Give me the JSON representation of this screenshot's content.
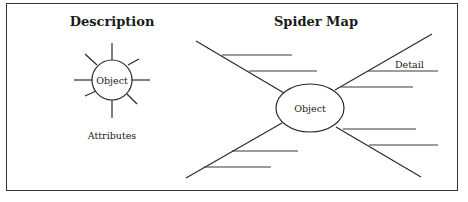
{
  "description_panel": {
    "title": "Description",
    "center_label": "Object",
    "caption": "Attributes",
    "ray_count": 8
  },
  "spider_map_panel": {
    "title": "Spider Map",
    "center_label": "Object",
    "detail_label": "Detail",
    "legs": [
      {
        "id": "upper-left",
        "branches": 2
      },
      {
        "id": "upper-right",
        "branches": 2
      },
      {
        "id": "lower-left",
        "branches": 2
      },
      {
        "id": "lower-right",
        "branches": 2
      }
    ]
  },
  "colors": {
    "line": "#2a2a2a",
    "text": "#1a1a1a",
    "background": "#ffffff"
  }
}
